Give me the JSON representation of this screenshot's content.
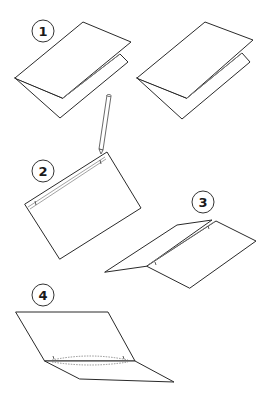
{
  "illustration": {
    "description": "Step-by-step paper folding instructions",
    "steps": [
      {
        "number": "1",
        "label": "1",
        "badge": {
          "cx": 43,
          "cy": 31
        }
      },
      {
        "number": "2",
        "label": "2",
        "badge": {
          "cx": 43,
          "cy": 171
        }
      },
      {
        "number": "3",
        "label": "3",
        "badge": {
          "cx": 203,
          "cy": 202
        }
      },
      {
        "number": "4",
        "label": "4",
        "badge": {
          "cx": 43,
          "cy": 295
        }
      }
    ],
    "colors": {
      "line": "#2a2a2a",
      "fold_line": "#8a8a8a",
      "background": "#ffffff"
    }
  }
}
